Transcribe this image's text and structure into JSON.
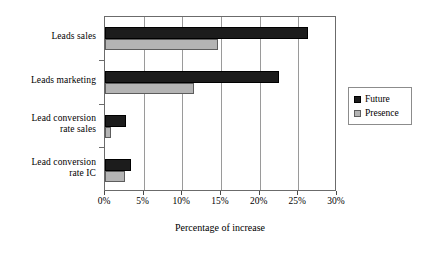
{
  "chart_data": {
    "type": "bar",
    "orientation": "horizontal",
    "title": "",
    "xlabel": "Percentage of increase",
    "ylabel": "",
    "xlim": [
      0,
      30
    ],
    "xticks": [
      0,
      5,
      10,
      15,
      20,
      25,
      30
    ],
    "xtick_labels": [
      "0%",
      "5%",
      "10%",
      "15%",
      "20%",
      "25%",
      "30%"
    ],
    "grid": true,
    "grid_axis": "x",
    "legend_position": "right",
    "categories": [
      "Leads sales",
      "Leads marketing",
      "Lead conversion rate sales",
      "Lead conversion rate IC"
    ],
    "category_lines": [
      [
        "Leads sales"
      ],
      [
        "Leads marketing"
      ],
      [
        "Lead conversion",
        "rate sales"
      ],
      [
        "Lead conversion",
        "rate IC"
      ]
    ],
    "series": [
      {
        "name": "Future",
        "color": "#1c1c1c",
        "values": [
          26.2,
          22.5,
          2.7,
          3.3
        ]
      },
      {
        "name": "Presence",
        "color": "#b4b4b4",
        "values": [
          14.6,
          11.5,
          0.8,
          2.6
        ]
      }
    ]
  },
  "legend": {
    "entries": [
      {
        "label": "Future",
        "swatch": "black-square-icon"
      },
      {
        "label": "Presence",
        "swatch": "gray-square-icon"
      }
    ]
  },
  "axis": {
    "x_title": "Percentage of increase"
  }
}
